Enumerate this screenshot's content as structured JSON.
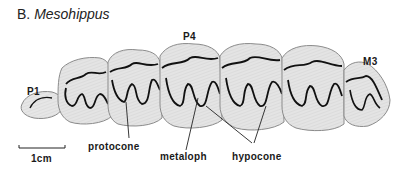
{
  "figure": {
    "panel_letter": "B.",
    "genus": "Mesohippus",
    "tooth_labels": {
      "p1": "P1",
      "p4": "P4",
      "m3": "M3"
    },
    "anatomy_labels": {
      "protocone": "protocone",
      "metaloph": "metaloph",
      "hypocone": "hypocone"
    },
    "scale_bar": {
      "label": "1cm"
    },
    "colors": {
      "enamel": "#111111",
      "crown_fill": "#e4e4e4",
      "crown_outline": "#8a8a8a",
      "leader": "#222222"
    }
  }
}
